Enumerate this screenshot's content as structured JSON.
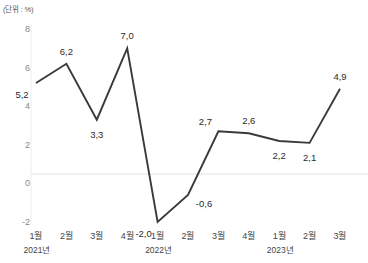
{
  "chart_data": {
    "type": "line",
    "title": "",
    "subtitle": "",
    "unit_label": "(단위 : %)",
    "xlabel": "",
    "ylabel": "",
    "ylim": [
      -2,
      8
    ],
    "yticks": [
      8,
      6,
      4,
      2,
      0,
      -2
    ],
    "ytick_labels": [
      "8",
      "6",
      "4",
      "2",
      "0",
      "-2"
    ],
    "grid": false,
    "zero_line": true,
    "legend": "none",
    "categories": [
      "1월",
      "2월",
      "3월",
      "4월",
      "1월",
      "2월",
      "3월",
      "4월",
      "1월",
      "2월",
      "3월"
    ],
    "groups": [
      {
        "label": "2021년",
        "index": 0
      },
      {
        "label": "2022년",
        "index": 4
      },
      {
        "label": "2023년",
        "index": 8
      }
    ],
    "values": [
      5.2,
      6.2,
      3.3,
      7.0,
      -2.0,
      -0.6,
      2.7,
      2.6,
      2.2,
      2.1,
      4.9
    ],
    "value_labels": [
      "5,2",
      "6,2",
      "3,3",
      "7,0",
      "-2,0",
      "-0,6",
      "2,7",
      "2,6",
      "2,2",
      "2,1",
      "4,9"
    ],
    "label_positions": [
      "below-left",
      "above",
      "below",
      "above",
      "below-left",
      "right",
      "above-left",
      "above",
      "below",
      "below",
      "above"
    ],
    "series": [
      {
        "name": "series-1",
        "color": "#3a3a3a",
        "values": [
          5.2,
          6.2,
          3.3,
          7.0,
          -2.0,
          -0.6,
          2.7,
          2.6,
          2.2,
          2.1,
          4.9
        ]
      }
    ],
    "colors": {
      "line": "#3a3a3a",
      "zero_line": "#e2e2e2",
      "axis": "#e2e2e2",
      "tick_text": "#888888",
      "label_text": "#2b2b2b"
    }
  }
}
